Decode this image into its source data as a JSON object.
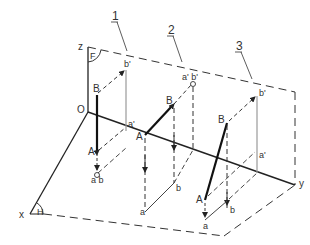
{
  "figure": {
    "colors": {
      "line": "#222222",
      "thin": "#777777",
      "text": "#333333",
      "background": "#ffffff"
    },
    "axes": {
      "x_label": "x",
      "y_label": "y",
      "z_label": "z",
      "origin_label": "O"
    },
    "planes": {
      "frontal_label": "F",
      "horizontal_label": "H"
    },
    "callouts": [
      {
        "number": "1"
      },
      {
        "number": "2"
      },
      {
        "number": "3"
      }
    ],
    "case1": {
      "A": "A",
      "B": "B",
      "a_prime": "a'",
      "b_prime": "b'",
      "ab": "a b"
    },
    "case2": {
      "A": "A",
      "B": "B",
      "ab_prime": "a' b'",
      "a": "a",
      "b": "b"
    },
    "case3": {
      "A": "A",
      "B": "B",
      "a_prime": "a'",
      "b_prime": "b'",
      "a": "a",
      "b": "b"
    }
  }
}
